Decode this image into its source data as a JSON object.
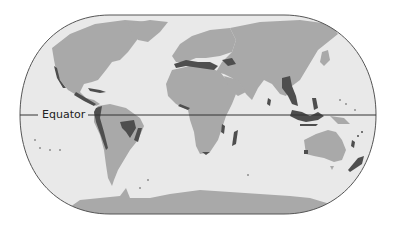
{
  "map": {
    "type": "world-map",
    "projection": "pseudo-cylindrical (rounded frame)",
    "colors": {
      "background": "#ffffff",
      "ocean": "#e9e9e9",
      "land": "#a9a9a9",
      "highlight": "#4e4e4e",
      "frame": "#555555",
      "equator_line": "#333333"
    },
    "labels": {
      "equator": "Equator"
    },
    "legend": null,
    "highlighted_regions": [
      "Western North America coast",
      "Central America / Mexico",
      "Caribbean islands",
      "Andes (western South America)",
      "Atlantic Forest / Cerrado (eastern Brazil)",
      "Mediterranean Basin",
      "Caucasus",
      "Western Ghats / Sri Lanka",
      "Indo-Burma / South China",
      "Philippines",
      "Sundaland / Wallacea (Indonesia)",
      "Madagascar",
      "Eastern African coast",
      "Southwest Australia",
      "New Zealand",
      "New Caledonia / Polynesia islands",
      "Cape region South Africa",
      "West African coast"
    ]
  }
}
